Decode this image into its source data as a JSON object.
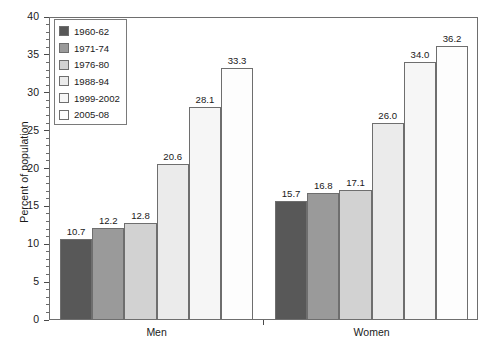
{
  "chart_data": {
    "type": "bar",
    "title": "",
    "xlabel": "",
    "ylabel": "Percent of population",
    "ylim": [
      0,
      40
    ],
    "ytick_labels": [
      "0",
      "5",
      "10",
      "15",
      "20",
      "25",
      "30",
      "35",
      "40"
    ],
    "ytick_values": [
      0,
      5,
      10,
      15,
      20,
      25,
      30,
      35,
      40
    ],
    "minor_tick_interval": 1,
    "grid": false,
    "legend_position": "top-left",
    "categories": [
      "Men",
      "Women"
    ],
    "series": [
      {
        "name": "1960-62",
        "color": "#585858",
        "values": [
          10.7,
          15.7
        ]
      },
      {
        "name": "1971-74",
        "color": "#9a9a9a",
        "values": [
          12.2,
          16.8
        ]
      },
      {
        "name": "1976-80",
        "color": "#d2d2d2",
        "values": [
          12.8,
          17.1
        ]
      },
      {
        "name": "1988-94",
        "color": "#ebebeb",
        "values": [
          20.6,
          26.0
        ]
      },
      {
        "name": "1999-2002",
        "color": "#f6f6f6",
        "values": [
          28.1,
          34.0
        ]
      },
      {
        "name": "2005-08",
        "color": "#fdfdfd",
        "values": [
          33.3,
          36.2
        ]
      }
    ],
    "bar_labels": {
      "Men": [
        "10.7",
        "12.2",
        "12.8",
        "20.6",
        "28.1",
        "33.3"
      ],
      "Women": [
        "15.7",
        "16.8",
        "17.1",
        "26.0",
        "34.0",
        "36.2"
      ]
    }
  },
  "legend": {
    "items": [
      {
        "label": "1960-62"
      },
      {
        "label": "1971-74"
      },
      {
        "label": "1976-80"
      },
      {
        "label": "1988-94"
      },
      {
        "label": "1999-2002"
      },
      {
        "label": "2005-08"
      }
    ]
  },
  "axis": {
    "y_title": "Percent of population",
    "group_labels": [
      "Men",
      "Women"
    ]
  }
}
